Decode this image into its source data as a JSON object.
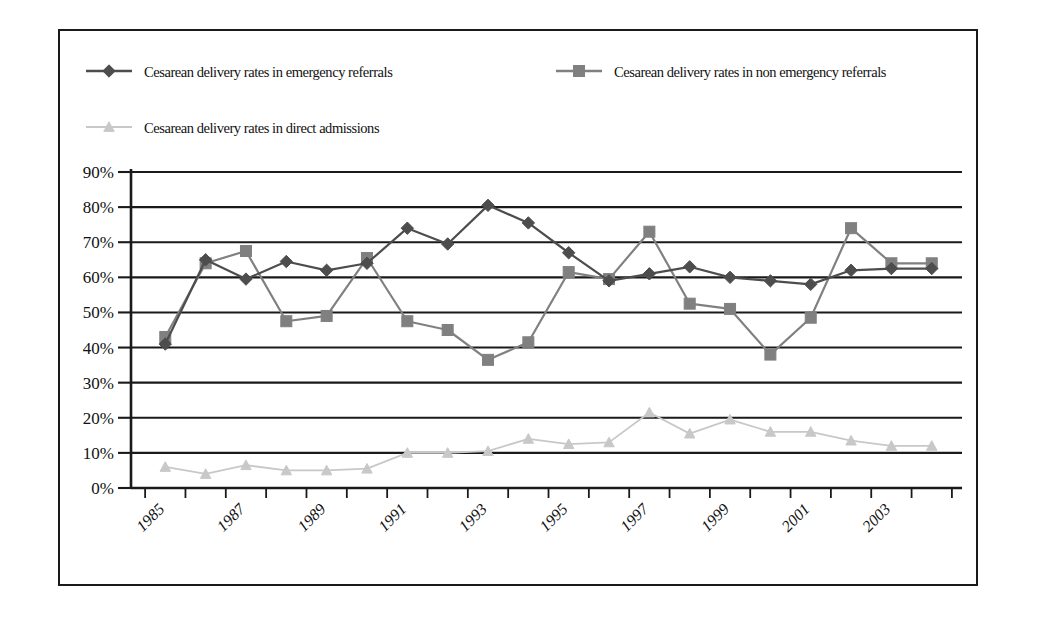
{
  "chart_data": {
    "type": "line",
    "title": "",
    "subtitle": "",
    "xlabel": "",
    "ylabel": "",
    "ylim": [
      0,
      90
    ],
    "ytick_labels": [
      "0%",
      "10%",
      "20%",
      "30%",
      "40%",
      "50%",
      "60%",
      "70%",
      "80%",
      "90%"
    ],
    "ytick_values": [
      0,
      10,
      20,
      30,
      40,
      50,
      60,
      70,
      80,
      90
    ],
    "grid": true,
    "legend_position": "top",
    "x": [
      1985,
      1986,
      1987,
      1988,
      1989,
      1990,
      1991,
      1992,
      1993,
      1994,
      1995,
      1996,
      1997,
      1998,
      1999,
      2000,
      2001,
      2002,
      2003,
      2004
    ],
    "categories": [
      "1985",
      "1986",
      "1987",
      "1988",
      "1989",
      "1990",
      "1991",
      "1992",
      "1993",
      "1994",
      "1995",
      "1996",
      "1997",
      "1998",
      "1999",
      "2000",
      "2001",
      "2002",
      "2003",
      "2004"
    ],
    "xtick_labels_shown": [
      "1985",
      "1987",
      "1989",
      "1991",
      "1993",
      "1995",
      "1997",
      "1999",
      "2001",
      "2003"
    ],
    "series": [
      {
        "name": "Cesarean delivery rates in emergency referrals",
        "marker": "diamond",
        "color": "#4d4d4d",
        "line_color": "#4d4d4d",
        "values": [
          41,
          65,
          59.5,
          64.5,
          62,
          64,
          74,
          69.5,
          80.5,
          75.5,
          67,
          59,
          61,
          63,
          60,
          59,
          58,
          62,
          62.5,
          62.5
        ]
      },
      {
        "name": "Cesarean delivery rates in non emergency referrals",
        "marker": "square",
        "color": "#808080",
        "line_color": "#808080",
        "values": [
          43,
          64,
          67.5,
          47.5,
          49,
          65.5,
          47.5,
          45,
          36.5,
          41.5,
          61.5,
          59.5,
          73,
          52.5,
          51,
          38,
          48.5,
          74,
          64,
          64
        ]
      },
      {
        "name": "Cesarean delivery rates in direct admissions",
        "marker": "triangle",
        "color": "#c8c8c8",
        "line_color": "#c8c8c8",
        "values": [
          6,
          4,
          6.5,
          5,
          5,
          5.5,
          10,
          10,
          10.5,
          14,
          12.5,
          13,
          21.5,
          15.5,
          19.5,
          16,
          16,
          13.5,
          12,
          12
        ]
      }
    ]
  },
  "legend": {
    "items": [
      {
        "label": "Cesarean delivery rates in emergency referrals",
        "marker": "diamond",
        "color": "#4d4d4d"
      },
      {
        "label": "Cesarean delivery rates in non emergency referrals",
        "marker": "square",
        "color": "#808080"
      },
      {
        "label": "Cesarean delivery rates in direct admissions",
        "marker": "triangle",
        "color": "#c8c8c8"
      }
    ]
  }
}
